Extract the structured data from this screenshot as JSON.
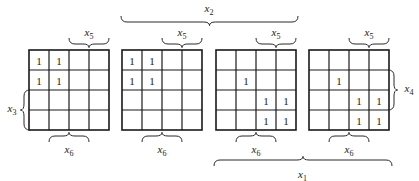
{
  "diagram": {
    "type": "karnaugh-map-6-variable",
    "maps": [
      {
        "id": "map-1",
        "cells": [
          [
            "1",
            "1",
            "",
            ""
          ],
          [
            "1",
            "1",
            "",
            ""
          ],
          [
            "",
            "",
            "",
            ""
          ],
          [
            "",
            "",
            "",
            ""
          ]
        ]
      },
      {
        "id": "map-2",
        "cells": [
          [
            "1",
            "1",
            "",
            ""
          ],
          [
            "1",
            "1",
            "",
            ""
          ],
          [
            "",
            "",
            "",
            ""
          ],
          [
            "",
            "",
            "",
            ""
          ]
        ]
      },
      {
        "id": "map-3",
        "cells": [
          [
            "",
            "",
            "",
            ""
          ],
          [
            "",
            "1",
            "",
            ""
          ],
          [
            "",
            "",
            "1",
            "1"
          ],
          [
            "",
            "",
            "1",
            "1"
          ]
        ]
      },
      {
        "id": "map-4",
        "cells": [
          [
            "",
            "",
            "",
            ""
          ],
          [
            "",
            "1",
            "",
            ""
          ],
          [
            "",
            "",
            "1",
            "1"
          ],
          [
            "",
            "",
            "1",
            "1"
          ]
        ]
      }
    ],
    "labels": {
      "x1": {
        "base": "x",
        "sub": "1"
      },
      "x2": {
        "base": "x",
        "sub": "2"
      },
      "x3": {
        "base": "x",
        "sub": "3"
      },
      "x4": {
        "base": "x",
        "sub": "4"
      },
      "x5": {
        "base": "x",
        "sub": "5"
      },
      "x6": {
        "base": "x",
        "sub": "6"
      }
    }
  }
}
